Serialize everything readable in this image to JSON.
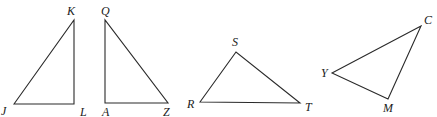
{
  "figure": {
    "line_color": "#2a2a2a",
    "background": "#ffffff"
  },
  "triangles": [
    {
      "name": "JKL",
      "vertices": {
        "J": {
          "label": "J",
          "x": 14,
          "y": 104
        },
        "K": {
          "label": "K",
          "x": 74,
          "y": 20
        },
        "L": {
          "label": "L",
          "x": 74,
          "y": 104
        }
      }
    },
    {
      "name": "QAZ",
      "vertices": {
        "Q": {
          "label": "Q",
          "x": 105,
          "y": 20
        },
        "A": {
          "label": "A",
          "x": 105,
          "y": 103
        },
        "Z": {
          "label": "Z",
          "x": 168,
          "y": 103
        }
      }
    },
    {
      "name": "RST",
      "vertices": {
        "R": {
          "label": "R",
          "x": 200,
          "y": 102
        },
        "S": {
          "label": "S",
          "x": 236,
          "y": 52
        },
        "T": {
          "label": "T",
          "x": 300,
          "y": 103
        }
      }
    },
    {
      "name": "YCM",
      "vertices": {
        "Y": {
          "label": "Y",
          "x": 332,
          "y": 73
        },
        "C": {
          "label": "C",
          "x": 421,
          "y": 26
        },
        "M": {
          "label": "M",
          "x": 388,
          "y": 99
        }
      }
    }
  ]
}
